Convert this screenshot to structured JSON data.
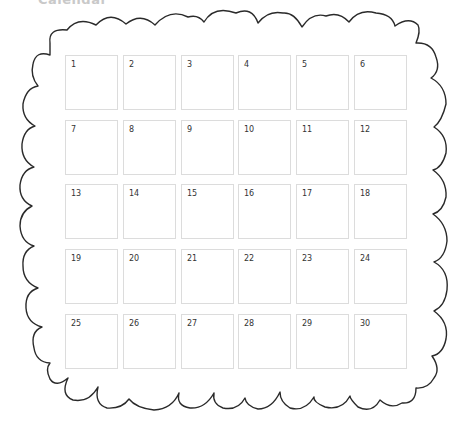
{
  "header": {
    "title": "Calendar"
  },
  "frame": {
    "style": "scalloped-cloud-border",
    "stroke_color": "#2a2a2a"
  },
  "grid": {
    "columns": 6,
    "rows": 5,
    "border_color": "#dcdcdc",
    "days": [
      "1",
      "2",
      "3",
      "4",
      "5",
      "6",
      "7",
      "8",
      "9",
      "10",
      "11",
      "12",
      "13",
      "14",
      "15",
      "16",
      "17",
      "18",
      "19",
      "20",
      "21",
      "22",
      "23",
      "24",
      "25",
      "26",
      "27",
      "28",
      "29",
      "30"
    ]
  }
}
